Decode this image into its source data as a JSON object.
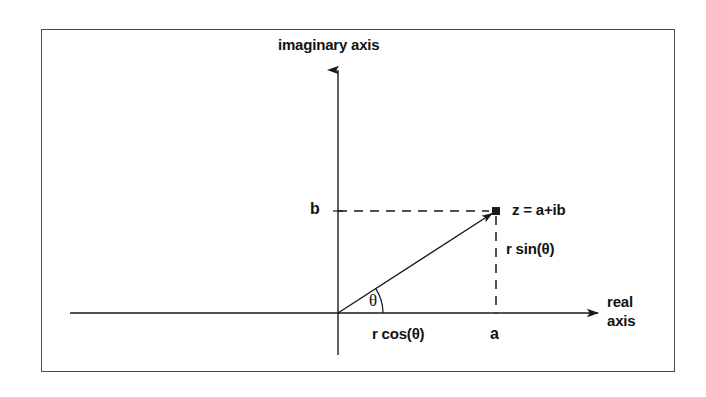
{
  "figure": {
    "frame": {
      "border_color": "#4a4a4a",
      "background": "#ffffff"
    },
    "stroke_color": "#1a1a1a",
    "text_color": "#121212",
    "axes": {
      "vertical": {
        "label": "imaginary axis",
        "x": 338,
        "y_top": 68,
        "y_bottom": 355,
        "arrow": "up"
      },
      "horizontal": {
        "label_line1": "real",
        "label_line2": "axis",
        "y": 313,
        "x_left": 70,
        "x_right": 600,
        "arrow": "right"
      },
      "origin": {
        "x": 338,
        "y": 313
      }
    },
    "point": {
      "label": "z = a+ib",
      "x": 496,
      "y": 211,
      "marker": "filled-square"
    },
    "annotations": {
      "real_part": "a",
      "imaginary_part": "b",
      "adjacent_leg": "r cos(θ)",
      "opposite_leg": "r sin(θ)",
      "angle": "θ"
    },
    "guides": {
      "horizontal_dashed": {
        "from_x": 338,
        "to_x": 496,
        "y": 211
      },
      "vertical_dashed": {
        "x": 496,
        "from_y": 211,
        "to_y": 313
      },
      "radius_line": {
        "from": [
          338,
          313
        ],
        "to": [
          496,
          211
        ]
      },
      "angle_arc_radius": 45
    }
  }
}
